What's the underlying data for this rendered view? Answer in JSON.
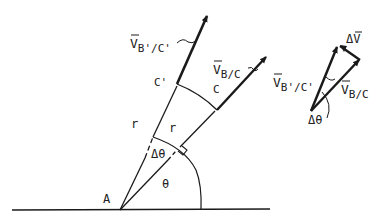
{
  "diagram": {
    "labels": {
      "v_bprime_cprime": {
        "main": "V",
        "sub": "B'/C'"
      },
      "v_b_c": {
        "main": "V",
        "sub": "B/C"
      },
      "c_prime": "C'",
      "c": "C",
      "r_outer": "r",
      "r_inner": "r",
      "delta_theta": "Δθ",
      "theta": "θ",
      "a": "A",
      "tri_delta_v": {
        "main": "ΔV"
      },
      "tri_v_bprime_cprime": {
        "main": "V",
        "sub": "B'/C'"
      },
      "tri_v_b_c": {
        "main": "V",
        "sub": "B/C"
      },
      "tri_delta_theta": "Δθ"
    },
    "colors": {
      "ink": "#1a1a1a",
      "background": "#ffffff"
    }
  }
}
